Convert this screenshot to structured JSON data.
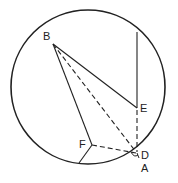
{
  "diagram": {
    "type": "geometry",
    "circle": {
      "cx": 88,
      "cy": 87,
      "r": 77
    },
    "points": {
      "B": {
        "x": 53,
        "y": 44,
        "label": "B"
      },
      "E": {
        "x": 137,
        "y": 108,
        "label": "E"
      },
      "F": {
        "x": 92,
        "y": 145,
        "label": "F"
      },
      "D": {
        "x": 137,
        "y": 150,
        "label": "D"
      },
      "A": {
        "x": 138,
        "y": 157,
        "label": "A"
      },
      "T": {
        "x": 137,
        "y": 32
      },
      "G": {
        "x": 79,
        "y": 163
      }
    },
    "solid_segments": [
      "B-E",
      "B-F",
      "F-G",
      "T-E"
    ],
    "dashed_segments": [
      "B-D",
      "E-D",
      "F-D"
    ],
    "labels": {
      "B": "B",
      "E": "E",
      "F": "F",
      "D": "D",
      "A": "A"
    }
  }
}
